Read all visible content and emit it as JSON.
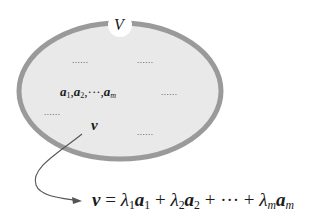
{
  "diagram": {
    "set_label": "V",
    "ellipse": {
      "fill": "#e9e9e9",
      "stroke": "#9a9a9a"
    },
    "basis": {
      "a": "a",
      "sub1": "1",
      "sub2": "2",
      "subm": "m",
      "comma": ",",
      "ellipsis": "···"
    },
    "vector": "v",
    "placeholders": [
      "......",
      "......",
      "......",
      "......",
      "......"
    ],
    "equation": {
      "lhs": "v",
      "equals": " = ",
      "lambda": "λ",
      "a": "a",
      "sub1": "1",
      "sub2": "2",
      "subm": "m",
      "plus": " + ",
      "ellipsis": "···"
    },
    "arrow_color": "#555555"
  }
}
